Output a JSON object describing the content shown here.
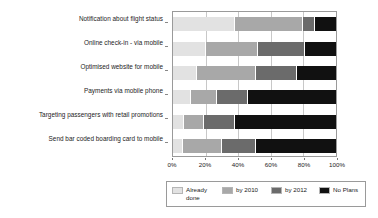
{
  "chart_data": {
    "type": "bar",
    "orientation": "horizontal",
    "stacked": true,
    "title": "",
    "xlabel": "",
    "ylabel": "",
    "xlim": [
      0,
      100
    ],
    "xticks": [
      "0%",
      "20%",
      "40%",
      "60%",
      "80%",
      "100%"
    ],
    "xtick_values": [
      0,
      20,
      40,
      60,
      80,
      100
    ],
    "grid": true,
    "legend_position": "bottom",
    "categories": [
      "Notification about flight status",
      "Online check-in - via mobile",
      "Optimised website for mobile",
      "Payments via mobile phone",
      "Targeting passengers with retail promotions",
      "Send bar coded boarding card to mobile"
    ],
    "series": [
      {
        "name": "Already done",
        "color": "#e2e2e2",
        "values": [
          38,
          20,
          15,
          11,
          7,
          6
        ]
      },
      {
        "name": "by 2010",
        "color": "#a8a8a8",
        "values": [
          42,
          32,
          36,
          16,
          12,
          24
        ]
      },
      {
        "name": "by 2012",
        "color": "#6b6b6b",
        "values": [
          7,
          29,
          25,
          19,
          19,
          21
        ]
      },
      {
        "name": "No Plans",
        "color": "#111111",
        "values": [
          13,
          19,
          24,
          54,
          62,
          49
        ]
      }
    ]
  },
  "legend": {
    "items": [
      {
        "label": "Already done"
      },
      {
        "label": "by 2010"
      },
      {
        "label": "by 2012"
      },
      {
        "label": "No Plans"
      }
    ]
  }
}
